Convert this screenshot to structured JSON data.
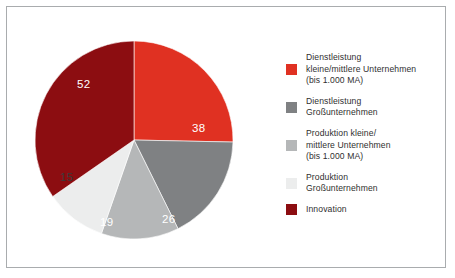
{
  "figure": {
    "background_color": "#ffffff",
    "border_color": "#a9acae"
  },
  "chart_data": {
    "type": "pie",
    "title": "",
    "subtitle": "",
    "xlabel": "",
    "ylabel": "",
    "total": 150,
    "start_angle_deg": 0,
    "direction": "clockwise",
    "grid": false,
    "legend_position": "right",
    "categories": [
      "Dienstleistung kleine/mittlere Unternehmen (bis 1.000 MA)",
      "Dienstleistung Großunternehmen",
      "Produktion kleine/mittlere Unternehmen (bis 1.000 MA)",
      "Produktion Großunternehmen",
      "Innovation"
    ],
    "values": [
      38,
      26,
      19,
      15,
      52
    ],
    "colors": [
      "#e03122",
      "#7f8183",
      "#b5b7b8",
      "#eceded",
      "#8c0d11"
    ],
    "label_colors": [
      "#ffffff",
      "#ffffff",
      "#ffffff",
      "#3b3b3b",
      "#ffffff"
    ],
    "slices": [
      {
        "label": "38",
        "value": 38,
        "color": "#e03122",
        "category": "Dienstleistung kleine/mittlere Unternehmen (bis 1.000 MA)"
      },
      {
        "label": "26",
        "value": 26,
        "color": "#7f8183",
        "category": "Dienstleistung Großunternehmen"
      },
      {
        "label": "19",
        "value": 19,
        "color": "#b5b7b8",
        "category": "Produktion kleine/mittlere Unternehmen (bis 1.000 MA)"
      },
      {
        "label": "15",
        "value": 15,
        "color": "#eceded",
        "category": "Produktion Großunternehmen"
      },
      {
        "label": "52",
        "value": 52,
        "color": "#8c0d11",
        "category": "Innovation"
      }
    ]
  },
  "data_labels": [
    {
      "text": "38",
      "x": 192,
      "y": 122,
      "color": "#ffffff"
    },
    {
      "text": "26",
      "x": 162,
      "y": 213,
      "color": "#ffffff"
    },
    {
      "text": "19",
      "x": 100,
      "y": 216,
      "color": "#ffffff"
    },
    {
      "text": "15",
      "x": 60,
      "y": 171,
      "color": "#3b3b3b"
    },
    {
      "text": "52",
      "x": 77,
      "y": 78,
      "color": "#ffffff"
    }
  ],
  "legend": {
    "items": [
      {
        "color": "#e03122",
        "swatch_name": "legend-swatch-dienstleistung-kmu",
        "label": "Dienstleistung\nkleine/mittlere Unternehmen\n(bis 1.000 MA)"
      },
      {
        "color": "#7f8183",
        "swatch_name": "legend-swatch-dienstleistung-gross",
        "label": "Dienstleistung\nGroßunternehmen"
      },
      {
        "color": "#b5b7b8",
        "swatch_name": "legend-swatch-produktion-kmu",
        "label": "Produktion kleine/\nmittlere Unternehmen\n(bis 1.000 MA)"
      },
      {
        "color": "#eceded",
        "swatch_name": "legend-swatch-produktion-gross",
        "label": "Produktion\nGroßunternehmen"
      },
      {
        "color": "#8c0d11",
        "swatch_name": "legend-swatch-innovation",
        "label": "Innovation"
      }
    ]
  }
}
